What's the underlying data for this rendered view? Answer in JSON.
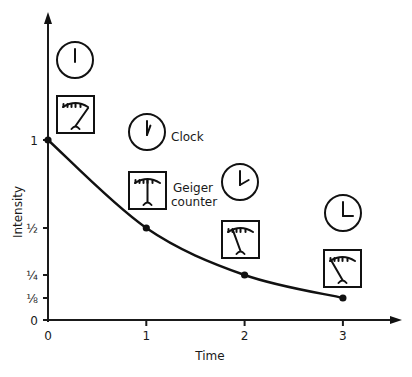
{
  "chart_data": {
    "type": "line",
    "title": "",
    "xlabel": "Time",
    "ylabel": "Intensity",
    "x": [
      0,
      1,
      2,
      3
    ],
    "values": [
      1,
      0.5,
      0.25,
      0.125
    ],
    "series": [
      {
        "name": "Intensity",
        "x": [
          0,
          1,
          2,
          3
        ],
        "values": [
          1,
          0.5,
          0.25,
          0.125
        ]
      }
    ],
    "xticks": [
      {
        "value": 0,
        "label": "0"
      },
      {
        "value": 1,
        "label": "1"
      },
      {
        "value": 2,
        "label": "2"
      },
      {
        "value": 3,
        "label": "3"
      }
    ],
    "yticks": [
      {
        "value": 0,
        "label": "0"
      },
      {
        "value": 0.125,
        "label": "⅛"
      },
      {
        "value": 0.25,
        "label": "¼"
      },
      {
        "value": 0.5,
        "label": "½"
      },
      {
        "value": 1,
        "label": "1"
      }
    ],
    "xlim": [
      0,
      3.5
    ],
    "ylim": [
      0,
      1.7
    ],
    "grid": false,
    "annotations": [
      {
        "text": "Clock",
        "near": "clock at time 1"
      },
      {
        "text": "Geiger counter",
        "near": "geiger counter at time 1"
      }
    ]
  },
  "labels": {
    "clock": "Clock",
    "geiger_line1": "Geiger",
    "geiger_line2": "counter",
    "xlabel": "Time",
    "ylabel": "Intensity"
  },
  "instruments": [
    {
      "time": 0,
      "clock_hand_hour_angle_deg": 0,
      "geiger_reading": "high"
    },
    {
      "time": 1,
      "clock_hand_hour_angle_deg": 20,
      "geiger_reading": "medium"
    },
    {
      "time": 2,
      "clock_hand_hour_angle_deg": 60,
      "geiger_reading": "low"
    },
    {
      "time": 3,
      "clock_hand_hour_angle_deg": 90,
      "geiger_reading": "lowest"
    }
  ]
}
